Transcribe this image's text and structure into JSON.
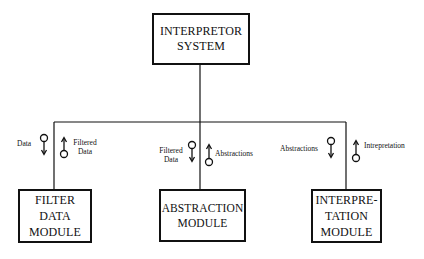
{
  "diagram": {
    "root": {
      "label": "INTERPRETOR\nSYSTEM"
    },
    "modules": [
      {
        "label": "FILTER\nDATA\nMODULE",
        "flows": [
          {
            "label": "Data",
            "direction": "down"
          },
          {
            "label": "Filtered\nData",
            "direction": "up"
          }
        ]
      },
      {
        "label": "ABSTRACTION\nMODULE",
        "flows": [
          {
            "label": "Filtered\nData",
            "direction": "down"
          },
          {
            "label": "Abstractions",
            "direction": "up"
          }
        ]
      },
      {
        "label": "INTERPRE-\nTATION\nMODULE",
        "flows": [
          {
            "label": "Abstractions",
            "direction": "down"
          },
          {
            "label": "Intrepretation",
            "direction": "up"
          }
        ]
      }
    ]
  },
  "colors": {
    "stroke": "#111111",
    "background": "#ffffff"
  }
}
